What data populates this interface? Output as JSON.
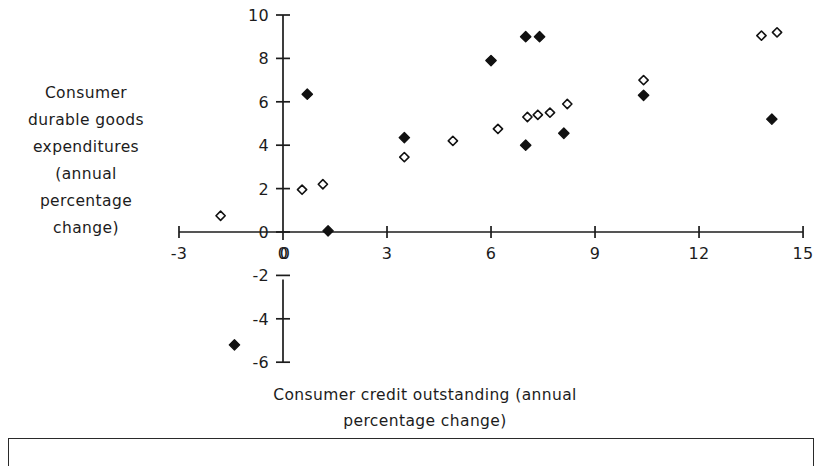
{
  "figure": {
    "background_color": "#ffffff",
    "ink_color": "#1c1c1c"
  },
  "axes": {
    "y_caption": "Consumer\ndurable goods\nexpenditures\n(annual\npercentage\nchange)",
    "x_caption": "Consumer credit outstanding (annual\npercentage change)",
    "x_tick_labels": [
      "-3",
      "0",
      "3",
      "6",
      "9",
      "12",
      "15"
    ],
    "y_tick_labels_positive": [
      "0",
      "2",
      "4",
      "6",
      "8",
      "10"
    ],
    "y_tick_labels_negative": [
      "-2",
      "-4",
      "-6"
    ]
  },
  "chart_data": {
    "type": "scatter",
    "title": "",
    "xlabel": "Consumer credit outstanding (annual percentage change)",
    "ylabel": "Consumer durable goods expenditures (annual percentage change)",
    "xlim": [
      -3,
      15
    ],
    "ylim": [
      -6,
      10
    ],
    "xticks": [
      -3,
      0,
      3,
      6,
      9,
      12,
      15
    ],
    "yticks": [
      -6,
      -4,
      -2,
      0,
      2,
      4,
      6,
      8,
      10
    ],
    "grid": false,
    "legend": "none",
    "series": [
      {
        "name": "filled-diamond",
        "marker": "filled diamond",
        "color": "#111111",
        "points": [
          [
            -1.4,
            -5.2
          ],
          [
            0.7,
            6.35
          ],
          [
            1.3,
            0.05
          ],
          [
            3.5,
            4.35
          ],
          [
            6.0,
            7.9
          ],
          [
            7.0,
            9.0
          ],
          [
            7.4,
            9.0
          ],
          [
            7.0,
            4.0
          ],
          [
            8.1,
            4.55
          ],
          [
            10.4,
            6.3
          ],
          [
            14.1,
            5.2
          ]
        ]
      },
      {
        "name": "open-diamond",
        "marker": "open diamond",
        "color": "#ffffff",
        "edge_color": "#111111",
        "points": [
          [
            -1.8,
            0.75
          ],
          [
            0.55,
            1.95
          ],
          [
            1.15,
            2.2
          ],
          [
            3.5,
            3.45
          ],
          [
            4.9,
            4.2
          ],
          [
            6.2,
            4.75
          ],
          [
            7.05,
            5.3
          ],
          [
            7.35,
            5.4
          ],
          [
            7.7,
            5.5
          ],
          [
            8.2,
            5.9
          ],
          [
            10.4,
            7.0
          ],
          [
            13.8,
            9.05
          ],
          [
            14.25,
            9.2
          ]
        ]
      }
    ]
  }
}
